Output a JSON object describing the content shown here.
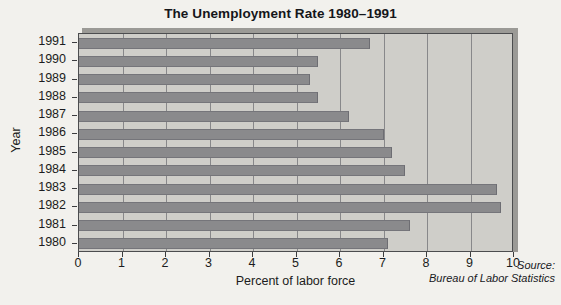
{
  "chart_data": {
    "type": "bar",
    "orientation": "horizontal",
    "title": "The Unemployment Rate 1980–1991",
    "xlabel": "Percent of labor force",
    "ylabel": "Year",
    "categories": [
      "1980",
      "1981",
      "1982",
      "1983",
      "1984",
      "1985",
      "1986",
      "1987",
      "1988",
      "1989",
      "1990",
      "1991"
    ],
    "values": [
      7.1,
      7.6,
      9.7,
      9.6,
      7.5,
      7.2,
      7.0,
      6.2,
      5.5,
      5.3,
      5.5,
      6.7
    ],
    "series": [
      {
        "name": "Unemployment rate",
        "values": [
          7.1,
          7.6,
          9.7,
          9.6,
          7.5,
          7.2,
          7.0,
          6.2,
          5.5,
          5.3,
          5.5,
          6.7
        ]
      }
    ],
    "xlim": [
      0,
      10
    ],
    "xticks": [
      0,
      1,
      2,
      3,
      4,
      5,
      6,
      7,
      8,
      9,
      10
    ],
    "xtick_labels": [
      "0",
      "1",
      "2",
      "3",
      "4",
      "5",
      "6",
      "7",
      "8",
      "9",
      "10"
    ],
    "grid": "vertical",
    "legend": "none",
    "annotations": [
      "Source:",
      "Bureau of Labor Statistics"
    ]
  },
  "title": {
    "text": "The Unemployment Rate 1980–1991"
  },
  "axes": {
    "x_title": "Percent of labor force",
    "y_title": "Year"
  },
  "source": {
    "line1": "Source:",
    "line2": "Bureau of Labor Statistics"
  },
  "colors": {
    "background": "#f2f1ed",
    "plot_background": "#cfcec9",
    "bar": "#8a8a8c",
    "grid": "#88888a",
    "axis": "#4c4d4f",
    "text": "#1b1c20"
  }
}
